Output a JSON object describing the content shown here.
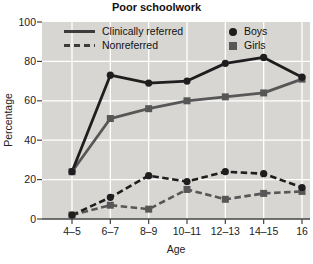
{
  "figure": {
    "title": "Poor schoolwork",
    "xlabel": "Age",
    "ylabel": "Percentage"
  },
  "legend": {
    "items": [
      {
        "label": "Clinically referred",
        "swatch": "solid-line"
      },
      {
        "label": "Nonreferred",
        "swatch": "dashed-line"
      },
      {
        "label": "Boys",
        "swatch": "circle"
      },
      {
        "label": "Girls",
        "swatch": "square"
      }
    ]
  },
  "chart_data": {
    "type": "line",
    "title": "Poor schoolwork",
    "xlabel": "Age",
    "ylabel": "Percentage",
    "categories": [
      "4–5",
      "6–7",
      "8–9",
      "10–11",
      "12–13",
      "14–15",
      "16"
    ],
    "ylim": [
      0,
      100
    ],
    "yticks": [
      0,
      20,
      40,
      60,
      80,
      100
    ],
    "grid": true,
    "legend_position": "top-inside",
    "series": [
      {
        "id": "clin_boys",
        "name": "Clinically referred — Boys",
        "group": "Clinically referred",
        "sex": "Boys",
        "line": "solid",
        "marker": "circle",
        "color": "#1e1e1e",
        "values": [
          24,
          73,
          69,
          70,
          79,
          82,
          72
        ]
      },
      {
        "id": "clin_girls",
        "name": "Clinically referred — Girls",
        "group": "Clinically referred",
        "sex": "Girls",
        "line": "solid",
        "marker": "square",
        "color": "#575757",
        "values": [
          24,
          51,
          56,
          60,
          62,
          64,
          71
        ]
      },
      {
        "id": "nonref_boys",
        "name": "Nonreferred — Boys",
        "group": "Nonreferred",
        "sex": "Boys",
        "line": "dashed",
        "marker": "circle",
        "color": "#1e1e1e",
        "values": [
          2,
          11,
          22,
          19,
          24,
          23,
          16
        ]
      },
      {
        "id": "nonref_girls",
        "name": "Nonreferred — Girls",
        "group": "Nonreferred",
        "sex": "Girls",
        "line": "dashed",
        "marker": "square",
        "color": "#575757",
        "values": [
          2,
          7,
          5,
          15,
          10,
          13,
          14
        ]
      }
    ],
    "colors": {
      "plot_bg": "#d7d6d2",
      "grid": "#ffffff",
      "axis": "#444444",
      "legend_line": "#3c3c3c",
      "boys": "#1e1e1e",
      "girls": "#575757",
      "text": "#222222"
    }
  }
}
